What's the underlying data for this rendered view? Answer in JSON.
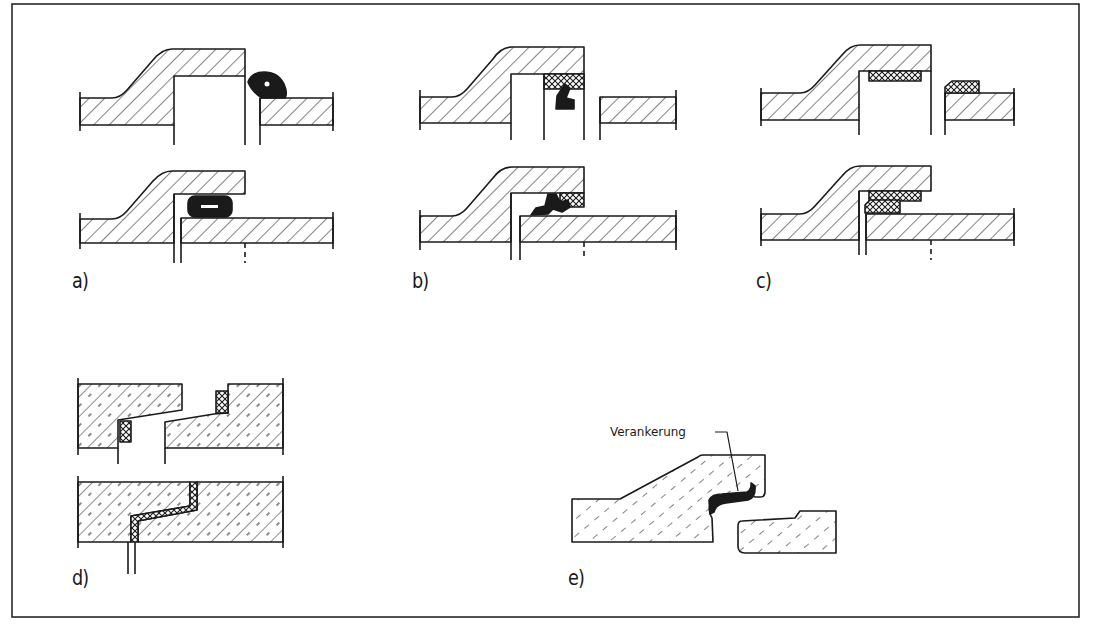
{
  "figure": {
    "stroke_color": "#1a1a1a",
    "background": "#ffffff",
    "panels": [
      {
        "id": "a",
        "label": "a)",
        "description": "Socket and spigot joint with black rubber ring seal (unassembled and assembled)"
      },
      {
        "id": "b",
        "label": "b)",
        "description": "Socket joint with profiled black lip seal and cross-hatched retaining ring"
      },
      {
        "id": "c",
        "label": "c)",
        "description": "Socket joint with cross-hatched sealing strips on socket and spigot"
      },
      {
        "id": "d",
        "label": "d)",
        "description": "Rebated concrete joint with cross-hatched sealant (unassembled and assembled)"
      },
      {
        "id": "e",
        "label": "e)",
        "description": "Concrete socket joint with anchored black lip seal"
      }
    ],
    "callouts": {
      "anchoring": "Verankerung"
    }
  }
}
